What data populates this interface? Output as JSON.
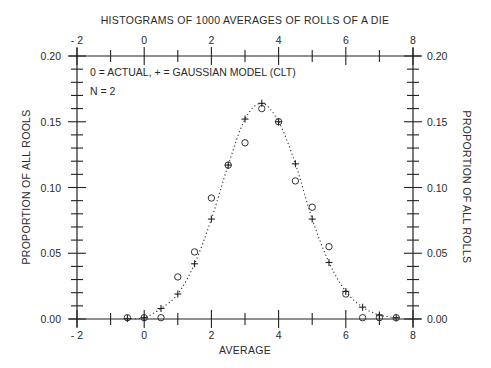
{
  "chart_data": {
    "type": "scatter",
    "title": "HISTOGRAMS OF 1000 AVERAGES OF ROLLS OF A DIE",
    "xlabel": "AVERAGE",
    "ylabel_left": "PROPORTION OF ALL ROOLS",
    "ylabel_right": "PROPORTION OF ALL ROLLS",
    "xlim": [
      -2,
      8
    ],
    "ylim": [
      0,
      0.2
    ],
    "x_major_ticks": [
      -2,
      0,
      2,
      4,
      6,
      8
    ],
    "x_tick_labels": [
      "- 2",
      "0",
      "2",
      "4",
      "6",
      "8"
    ],
    "x_minor_step": 1,
    "y_major_ticks": [
      0,
      0.05,
      0.1,
      0.15,
      0.2
    ],
    "y_tick_labels": [
      "0.00",
      "0.05",
      "0.10",
      "0.15",
      "0.20"
    ],
    "y_minor_step": 0.01,
    "grid": false,
    "annotations": [
      "0 = ACTUAL, + = GAUSSIAN MODEL (CLT)",
      "N = 2"
    ],
    "series": [
      {
        "name": "Actual",
        "marker": "circle",
        "x": [
          -0.5,
          0,
          0.5,
          1.0,
          1.5,
          2.0,
          2.5,
          3.0,
          3.5,
          4.0,
          4.5,
          5.0,
          5.5,
          6.0,
          6.5,
          7.0,
          7.5
        ],
        "y": [
          0.001,
          0.001,
          0.001,
          0.032,
          0.051,
          0.092,
          0.117,
          0.134,
          0.16,
          0.15,
          0.105,
          0.085,
          0.055,
          0.019,
          0.001,
          0.001,
          0.001
        ]
      },
      {
        "name": "Gaussian model (CLT)",
        "marker": "cross",
        "line": "dotted",
        "x": [
          -0.5,
          0,
          0.5,
          1.0,
          1.5,
          2.0,
          2.5,
          3.0,
          3.5,
          4.0,
          4.5,
          5.0,
          5.5,
          6.0,
          6.5,
          7.0,
          7.5
        ],
        "y": [
          0.0003,
          0.001,
          0.008,
          0.019,
          0.042,
          0.076,
          0.117,
          0.152,
          0.164,
          0.15,
          0.118,
          0.076,
          0.043,
          0.021,
          0.009,
          0.003,
          0.001
        ]
      }
    ]
  }
}
